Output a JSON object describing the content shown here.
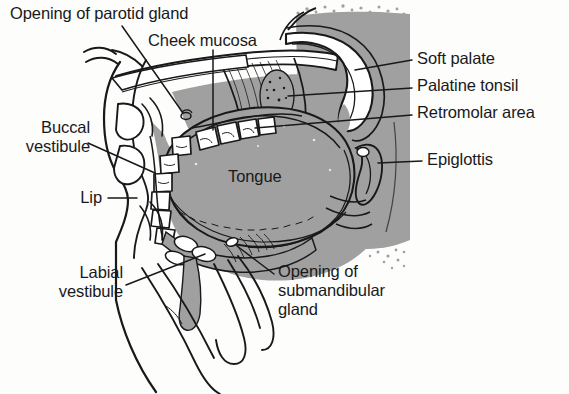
{
  "figure": {
    "width": 569,
    "height": 394
  },
  "colors": {
    "background": "#fdfdfc",
    "ink": "#19191b",
    "tissue_gray": "#a0a0a0",
    "shadow_gray": "#9d9d9d",
    "light_gray": "#c9c9c9",
    "white": "#ffffff"
  },
  "labels": [
    {
      "id": "opening-of-parotid-gland",
      "text": "Opening of parotid gland",
      "align": "left",
      "x": 10,
      "y": 4
    },
    {
      "id": "cheek-mucosa",
      "text": "Cheek mucosa",
      "align": "left",
      "x": 148,
      "y": 31
    },
    {
      "id": "soft-palate",
      "text": "Soft palate",
      "align": "left",
      "x": 417,
      "y": 49
    },
    {
      "id": "palatine-tonsil",
      "text": "Palatine tonsil",
      "align": "left",
      "x": 417,
      "y": 76
    },
    {
      "id": "retromolar-area",
      "text": "Retromolar area",
      "align": "left",
      "x": 417,
      "y": 103
    },
    {
      "id": "epiglottis",
      "text": "Epiglottis",
      "align": "left",
      "x": 427,
      "y": 150
    },
    {
      "id": "buccal-vestibule",
      "text": "Buccal\nvestibule",
      "align": "right",
      "x": 12,
      "y": 118
    },
    {
      "id": "lip",
      "text": "Lip",
      "align": "right",
      "x": 70,
      "y": 188
    },
    {
      "id": "labial-vestibule",
      "text": "Labial\nvestibule",
      "align": "right",
      "x": 55,
      "y": 263
    },
    {
      "id": "tongue",
      "text": "Tongue",
      "align": "center",
      "x": 228,
      "y": 167
    },
    {
      "id": "opening-of-submandibular-gland",
      "text": "Opening of\nsubmandibular\ngland",
      "align": "left",
      "x": 278,
      "y": 262
    }
  ],
  "leader_lines": [
    {
      "id": "leader-opening-of-parotid-gland",
      "from_label": "opening-of-parotid-gland",
      "points": "122,26 183,113"
    },
    {
      "id": "leader-cheek-mucosa",
      "from_label": "cheek-mucosa",
      "points": "213,50 213,130"
    },
    {
      "id": "leader-soft-palate",
      "from_label": "soft-palate",
      "points": "412,60 355,70"
    },
    {
      "id": "leader-palatine-tonsil",
      "from_label": "palatine-tonsil",
      "points": "412,88 288,96"
    },
    {
      "id": "leader-retromolar-area",
      "from_label": "retromolar-area",
      "points": "412,115 255,128"
    },
    {
      "id": "leader-epiglottis",
      "from_label": "epiglottis",
      "points": "422,161 378,163"
    },
    {
      "id": "leader-buccal-vestibule",
      "from_label": "buccal-vestibule",
      "points": "88,143 155,173"
    },
    {
      "id": "leader-lip",
      "from_label": "lip",
      "points": "108,198 137,198"
    },
    {
      "id": "leader-labial-vestibule",
      "from_label": "labial-vestibule",
      "points": "126,285 205,254"
    },
    {
      "id": "leader-opening-of-submandibular-gland",
      "from_label": "opening-of-submandibular-gland",
      "points": "274,274 237,246"
    }
  ],
  "anatomy_parts": [
    {
      "id": "tongue-body",
      "name": "Tongue"
    },
    {
      "id": "soft-palate-arch",
      "name": "Soft palate"
    },
    {
      "id": "palatine-tonsil-mass",
      "name": "Palatine tonsil"
    },
    {
      "id": "retromolar-region",
      "name": "Retromolar area"
    },
    {
      "id": "epiglottis-flap",
      "name": "Epiglottis"
    },
    {
      "id": "upper-teeth",
      "name": "Upper dental arch"
    },
    {
      "id": "lower-teeth",
      "name": "Lower dental arch"
    },
    {
      "id": "lip-profile",
      "name": "Lip"
    },
    {
      "id": "buccal-vestibule-space",
      "name": "Buccal vestibule"
    },
    {
      "id": "labial-vestibule-space",
      "name": "Labial vestibule"
    },
    {
      "id": "parotid-duct-opening",
      "name": "Opening of parotid gland"
    },
    {
      "id": "submandibular-duct-opening",
      "name": "Opening of submandibular gland"
    },
    {
      "id": "cheek-mucosa-surface",
      "name": "Cheek mucosa"
    },
    {
      "id": "mandible-chin",
      "name": "Mandible and chin"
    },
    {
      "id": "pharynx-shading",
      "name": "Pharyngeal background shading"
    }
  ]
}
